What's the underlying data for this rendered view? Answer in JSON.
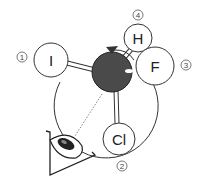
{
  "diagram": {
    "type": "molecular-model-projection",
    "central_atom": {
      "label": "",
      "color": "#4a4a4a"
    },
    "substituents": [
      {
        "label": "I",
        "priority": "①"
      },
      {
        "label": "Cl",
        "priority": "②"
      },
      {
        "label": "F",
        "priority": "③"
      },
      {
        "label": "H",
        "priority": "④"
      }
    ],
    "viewer": "eye-icon",
    "rotation_arrow": "counterclockwise-arrow"
  }
}
